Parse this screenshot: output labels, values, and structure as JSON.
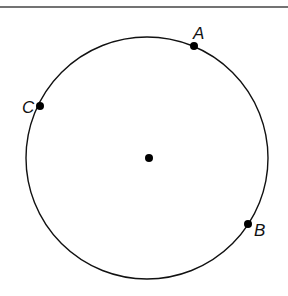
{
  "diagram": {
    "type": "circle-with-points",
    "circle": {
      "cx": 147,
      "cy": 158,
      "r": 121
    },
    "center_point": {
      "x": 149,
      "y": 158
    },
    "points": [
      {
        "label": "A",
        "x": 194,
        "y": 46,
        "label_x": 193,
        "label_y": 39
      },
      {
        "label": "B",
        "x": 248,
        "y": 224,
        "label_x": 254,
        "label_y": 236
      },
      {
        "label": "C",
        "x": 40,
        "y": 106,
        "label_x": 22,
        "label_y": 113
      }
    ],
    "top_rule": {
      "y": 7
    }
  }
}
